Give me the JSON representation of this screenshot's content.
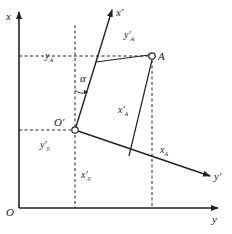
{
  "diagram": {
    "type": "coordinate-transformation",
    "colors": {
      "line": "#222222",
      "background": "#ffffff"
    },
    "axes": {
      "x": {
        "label": "x"
      },
      "y": {
        "label": "y"
      },
      "origin": {
        "label": "O"
      },
      "x_prime": {
        "label": "x'"
      },
      "y_prime": {
        "label": "y'"
      },
      "origin_prime": {
        "label": "O'"
      }
    },
    "points": {
      "A": {
        "label": "A"
      },
      "O_prime": {
        "label": "O'"
      }
    },
    "labels": {
      "y_A": "y",
      "y_A_sub": "A",
      "y_prime_A": "y'",
      "y_prime_A_sub": "A",
      "x_prime_A": "x'",
      "x_prime_A_sub": "A",
      "x_A": "x",
      "x_A_sub": "A",
      "y_prime_0": "y'",
      "y_prime_0_sub": "0",
      "x_prime_0": "x'",
      "x_prime_0_sub": "0",
      "alpha": "α"
    }
  }
}
